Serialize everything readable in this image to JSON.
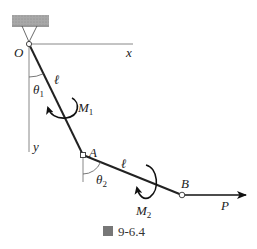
{
  "figure": {
    "caption_icon": "图",
    "caption_number": "9-6.4"
  },
  "labels": {
    "origin": "O",
    "x_axis": "x",
    "y_axis": "y",
    "link1_length": "ℓ",
    "link2_length": "ℓ",
    "theta1": "θ",
    "theta1_sub": "1",
    "theta2": "θ",
    "theta2_sub": "2",
    "moment1": "M",
    "moment1_sub": "1",
    "moment2": "M",
    "moment2_sub": "2",
    "joint_a": "A",
    "joint_b": "B",
    "force": "P"
  },
  "geometry": {
    "O": [
      29,
      44
    ],
    "A": [
      83,
      155
    ],
    "B": [
      182,
      195
    ],
    "P_end": [
      246,
      195
    ],
    "x_axis_end": [
      133,
      44
    ],
    "y_axis_end": [
      29,
      152
    ]
  },
  "colors": {
    "line": "#222222",
    "axis": "#888888",
    "ground": "#9a9a9a"
  }
}
